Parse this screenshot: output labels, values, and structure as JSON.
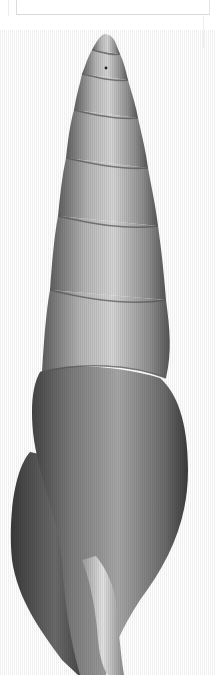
{
  "image": {
    "subject": "gastropod shell (high-spired, turreted)",
    "view": "apertural side, apex up",
    "background": "#ffffff",
    "colors": {
      "shell_light": "#d6d6d6",
      "shell_mid": "#9a9a9a",
      "shell_dark": "#4a4a4a",
      "frame_line": "#d8d8d8"
    }
  }
}
